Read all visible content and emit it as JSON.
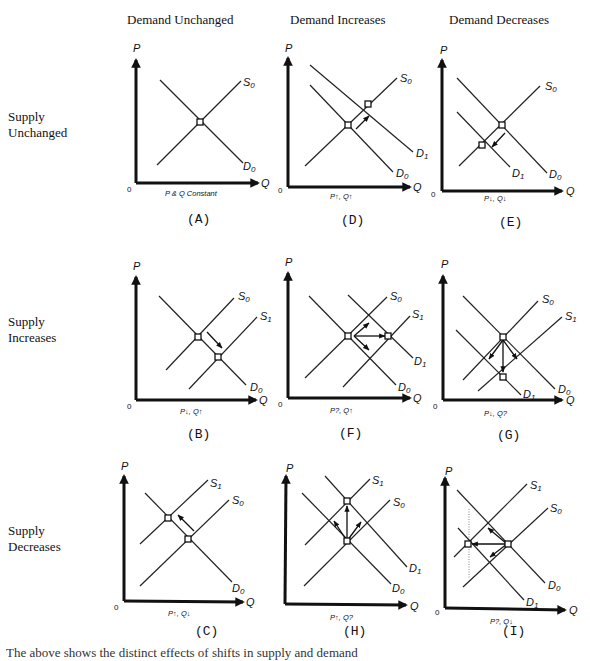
{
  "columns": [
    {
      "label": "Demand Unchanged"
    },
    {
      "label": "Demand Increases"
    },
    {
      "label": "Demand Decreases"
    }
  ],
  "rows": [
    {
      "label_line1": "Supply",
      "label_line2": "Unchanged"
    },
    {
      "label_line1": "Supply",
      "label_line2": "Increases"
    },
    {
      "label_line1": "Supply",
      "label_line2": "Decreases"
    }
  ],
  "axes": {
    "y": "P",
    "x": "Q",
    "origin": "0"
  },
  "panels": {
    "A": {
      "label": "(A)",
      "note": "P & Q Constant",
      "curves": [
        "S0",
        "D0"
      ]
    },
    "D": {
      "label": "(D)",
      "note": "P↑, Q↑",
      "curves": [
        "S0",
        "D1",
        "D0"
      ]
    },
    "E": {
      "label": "(E)",
      "note": "P↓, Q↓",
      "curves": [
        "S0",
        "D1",
        "D0"
      ]
    },
    "B": {
      "label": "(B)",
      "note": "P↓, Q↑",
      "curves": [
        "S0",
        "S1",
        "D0"
      ]
    },
    "F": {
      "label": "(F)",
      "note": "P?, Q↑",
      "curves": [
        "S0",
        "S1",
        "D1",
        "D0"
      ]
    },
    "G": {
      "label": "(G)",
      "note": "P↓, Q?",
      "curves": [
        "S0",
        "S1",
        "D1",
        "D0"
      ]
    },
    "C": {
      "label": "(C)",
      "note": "P↑, Q↓",
      "curves": [
        "S1",
        "S0",
        "D0"
      ]
    },
    "H": {
      "label": "(H)",
      "note": "P↑, Q?",
      "curves": [
        "S1",
        "S0",
        "D1",
        "D0"
      ]
    },
    "I": {
      "label": "(I)",
      "note": "P?, Q↓",
      "curves": [
        "S1",
        "S0",
        "D0",
        "D1"
      ]
    }
  },
  "curve_labels": {
    "S0": "S",
    "S1": "S",
    "D0": "D",
    "D1": "D",
    "sub0": "0",
    "sub1": "1"
  },
  "caption_partial": "The above shows the distinct effects of shifts in supply and demand"
}
